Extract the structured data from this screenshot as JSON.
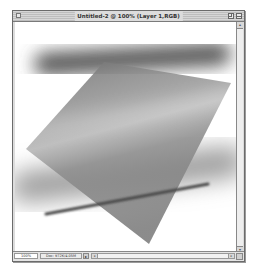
{
  "window": {
    "title": "Untitled-2 @ 100% (Layer 1,RGB)",
    "controls": {
      "close_icon": "close-box-icon",
      "zoom_icon": "zoom-box-icon",
      "collapse_icon": "collapse-box-icon"
    }
  },
  "statusbar": {
    "zoom_level": "100%",
    "doc_info": "Doc: 972K/4.05M",
    "doc_arrow": "▸"
  },
  "scrollbars": {
    "vertical": {
      "up": "▴",
      "down": "▾"
    },
    "horizontal": {
      "left": "◂",
      "right": "▸"
    }
  },
  "canvas": {
    "background": "#ffffff",
    "shapes": [
      {
        "type": "blurred-bar",
        "color": "#505050",
        "from": [
          30,
          42
        ],
        "to": [
          205,
          32
        ],
        "thickness": 22
      },
      {
        "type": "blurred-bar",
        "color": "#9a9a9a",
        "from": [
          10,
          165
        ],
        "to": [
          215,
          140
        ],
        "thickness": 30
      },
      {
        "type": "polygon",
        "color": "#8a8a8a",
        "points": [
          [
            89,
            40
          ],
          [
            216,
            61
          ],
          [
            134,
            222
          ],
          [
            11,
            127
          ]
        ]
      },
      {
        "type": "line",
        "color": "#4a4a4a",
        "from": [
          31,
          192
        ],
        "to": [
          193,
          162
        ],
        "thickness": 3
      }
    ]
  }
}
